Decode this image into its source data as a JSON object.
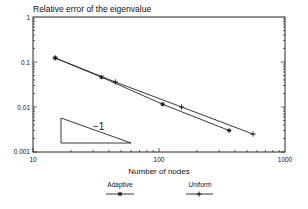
{
  "chart_data": {
    "type": "line",
    "title": "Relative error of the eigenvalue",
    "xlabel": "Number of nodes",
    "ylabel": "",
    "xscale": "log",
    "yscale": "log",
    "xlim": [
      10,
      1000
    ],
    "ylim": [
      0.001,
      1
    ],
    "xticks": [
      "10",
      "100",
      "1000"
    ],
    "yticks": [
      "1",
      "0.1",
      "0.01",
      "0.001"
    ],
    "grid": false,
    "legend_position": "bottom",
    "series": [
      {
        "name": "Adaptive",
        "marker": "star",
        "x": [
          15,
          35,
          107,
          360
        ],
        "y": [
          0.123,
          0.046,
          0.0115,
          0.003
        ]
      },
      {
        "name": "Uniform",
        "marker": "plus",
        "x": [
          15,
          45,
          151,
          558
        ],
        "y": [
          0.123,
          0.036,
          0.01,
          0.0025
        ]
      }
    ],
    "annotations": [
      {
        "type": "slope-triangle",
        "label": "−1"
      }
    ]
  },
  "labels": {
    "title": "Relative error of the eigenvalue",
    "xlabel": "Number of nodes",
    "slope": "−1",
    "legend_adaptive": "Adaptive",
    "legend_uniform": "Uniform",
    "x10": "10",
    "x100": "100",
    "x1000": "1000",
    "y1": "1",
    "y01": "0.1",
    "y001": "0.01",
    "y0001": "0.001"
  }
}
